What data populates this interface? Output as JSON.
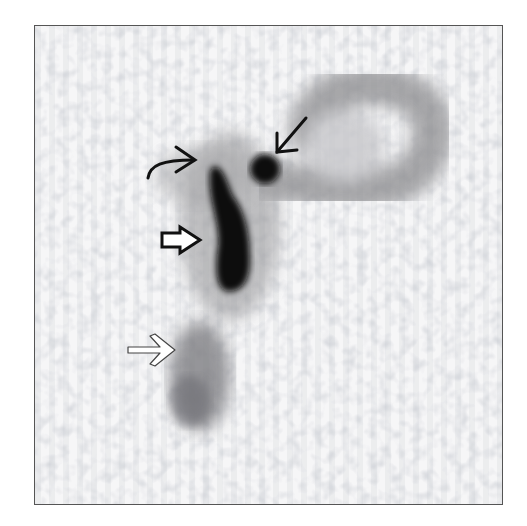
{
  "image": {
    "type": "scintigraphy",
    "background_color": "#ffffff",
    "frame_color": "#555555",
    "frame": {
      "x": 34,
      "y": 25,
      "width": 467,
      "height": 478
    }
  },
  "structures": [
    {
      "name": "bowel-loop",
      "shape": "loop",
      "intensity": "moderate",
      "color": "#8a8a8a"
    },
    {
      "name": "focal-hot-spot",
      "shape": "round",
      "intensity": "intense",
      "color": "#0a0a0a"
    },
    {
      "name": "vertical-tubular-activity",
      "shape": "elongated",
      "intensity": "intense",
      "color": "#050505"
    },
    {
      "name": "lower-faint-activity",
      "shape": "elongated",
      "intensity": "faint",
      "color": "#7d7d7d"
    }
  ],
  "annotations": [
    {
      "name": "curved-arrow",
      "style": "black-curved",
      "points_to": "upper-tubular-activity"
    },
    {
      "name": "straight-arrow",
      "style": "black-thin",
      "points_to": "focal-hot-spot"
    },
    {
      "name": "block-arrow",
      "style": "black-open-block",
      "points_to": "vertical-tubular-activity"
    },
    {
      "name": "open-arrow",
      "style": "white-outlined",
      "points_to": "lower-faint-activity"
    }
  ]
}
